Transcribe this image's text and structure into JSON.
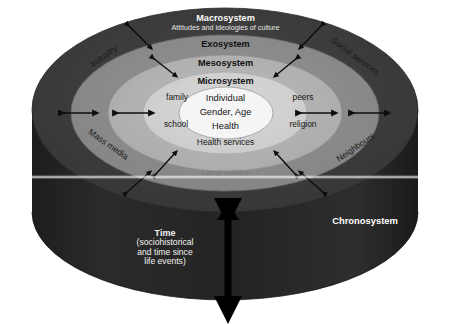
{
  "diagram": {
    "type": "concentric-ellipse-cylinder",
    "rings": [
      {
        "id": "macrosystem",
        "label": "Macrosystem",
        "sublabel": "Attitudes and ideologies of culture",
        "color": "#3b3b3b",
        "label_color": "#ffffff"
      },
      {
        "id": "exosystem",
        "label": "Exosystem",
        "color": "#8c8c8c",
        "label_color": "#111111"
      },
      {
        "id": "mesosystem",
        "label": "Mesosystem",
        "color": "#b4b4b4",
        "label_color": "#111111"
      },
      {
        "id": "microsystem",
        "label": "Microsystem",
        "color": "#d2d2d2",
        "label_color": "#111111"
      },
      {
        "id": "individual",
        "label": "Individual",
        "color": "#f4f4f4",
        "label_color": "#111111"
      }
    ],
    "core": {
      "line1": "Individual",
      "line2": "Gender, Age",
      "line3": "Health"
    },
    "microsystem_nodes": [
      {
        "id": "family",
        "label": "family"
      },
      {
        "id": "peers",
        "label": "peers"
      },
      {
        "id": "school",
        "label": "school"
      },
      {
        "id": "religion",
        "label": "religion"
      },
      {
        "id": "health-services",
        "label": "Health services"
      }
    ],
    "exosystem_nodes": [
      {
        "id": "industry",
        "label": "Industry"
      },
      {
        "id": "social-services",
        "label": "Social services"
      },
      {
        "id": "mass-media",
        "label": "Mass media"
      },
      {
        "id": "neighbours",
        "label": "Neighbours"
      },
      {
        "id": "local-politics",
        "label": "Local politics"
      }
    ],
    "chronosystem": {
      "label": "Chronosystem",
      "time_head": "Time",
      "time_line1": "(sociohistorical",
      "time_line2": "and time since",
      "time_line3": "life events)",
      "cylinder_color": "#262626",
      "arrow_color": "#000000"
    }
  }
}
